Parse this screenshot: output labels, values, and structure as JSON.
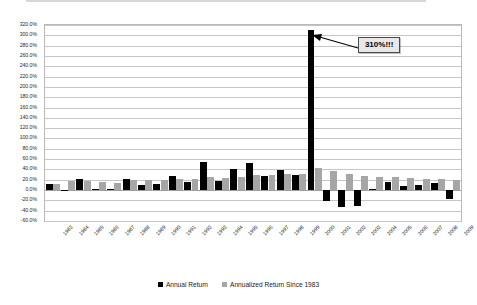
{
  "chart_data": {
    "type": "bar",
    "title": "",
    "subtitle": "",
    "xlabel": "",
    "ylabel": "",
    "ylim": [
      -60,
      320
    ],
    "ytick_step": 20,
    "grid": true,
    "legend_position": "bottom",
    "categories": [
      "1983",
      "1984",
      "1985",
      "1986",
      "1987",
      "1988",
      "1989",
      "1990",
      "1991",
      "1992",
      "1993",
      "1994",
      "1995",
      "1996",
      "1997",
      "1998",
      "1999",
      "2000",
      "2001",
      "2002",
      "2003",
      "2004",
      "2005",
      "2006",
      "2007",
      "2008",
      "2009"
    ],
    "ytick_labels": [
      "320.0%",
      "300.0%",
      "280.0%",
      "260.0%",
      "240.0%",
      "220.0%",
      "200.0%",
      "180.0%",
      "160.0%",
      "140.0%",
      "120.0%",
      "100.0%",
      "80.0%",
      "60.0%",
      "40.0%",
      "20.0%",
      "0.0%",
      "-20.0%",
      "-40.0%",
      "-60.0%"
    ],
    "ytick_values": [
      320,
      300,
      280,
      260,
      240,
      220,
      200,
      180,
      160,
      140,
      120,
      100,
      80,
      60,
      40,
      20,
      0,
      -20,
      -40,
      -60
    ],
    "series": [
      {
        "name": "Annual Return",
        "color": "#000000",
        "values": [
          11,
          1,
          21,
          2,
          3,
          22,
          9,
          11,
          27,
          16,
          55,
          17,
          40,
          52,
          27,
          38,
          30,
          310,
          -21,
          -32,
          -30,
          3,
          15,
          8,
          10,
          13,
          -17
        ]
      },
      {
        "name": "Annualized Return Since 1983",
        "color": "#A6A6A6",
        "values": [
          11,
          17,
          18,
          16,
          14,
          19,
          19,
          19,
          22,
          22,
          25,
          24,
          26,
          30,
          30,
          31,
          31,
          42,
          36,
          32,
          27,
          25,
          25,
          23,
          22,
          21,
          19
        ]
      }
    ],
    "annotations": [
      {
        "name": "peak-callout",
        "text": "310%!!!",
        "points_to_category": "2000",
        "points_to_value": 310
      }
    ]
  },
  "legend": {
    "items": [
      {
        "label": "Annual Return",
        "color": "#000000"
      },
      {
        "label": "Annualized Return Since 1983",
        "color": "#A6A6A6"
      }
    ]
  }
}
